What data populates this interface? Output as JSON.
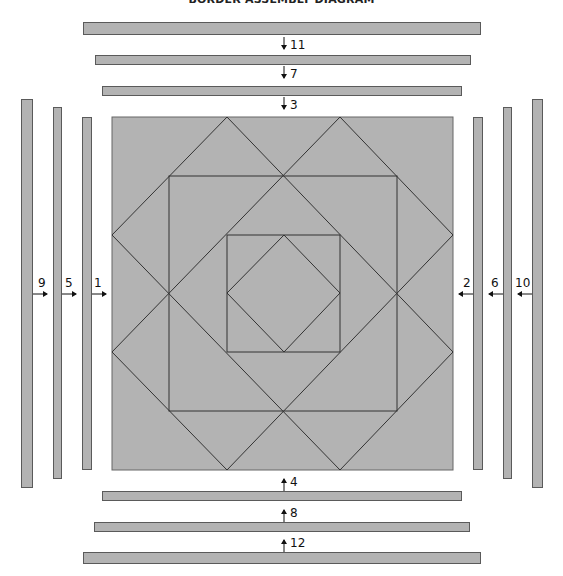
{
  "title": "BORDER ASSEMBLY DIAGRAM",
  "colors": {
    "fabric": "#b3b3b3",
    "outline": "#5a5a5a",
    "seam": "#333333",
    "background": "#ffffff"
  },
  "center_block": {
    "label": "Quilt center",
    "description": "Square-in-a-square block with diamonds",
    "grid_units": 6
  },
  "borders": {
    "top": [
      {
        "number": "11",
        "order": 11,
        "side": "top",
        "arrow": "down"
      },
      {
        "number": "7",
        "order": 7,
        "side": "top",
        "arrow": "down"
      },
      {
        "number": "3",
        "order": 3,
        "side": "top",
        "arrow": "down"
      }
    ],
    "bottom": [
      {
        "number": "4",
        "order": 4,
        "side": "bottom",
        "arrow": "up"
      },
      {
        "number": "8",
        "order": 8,
        "side": "bottom",
        "arrow": "up"
      },
      {
        "number": "12",
        "order": 12,
        "side": "bottom",
        "arrow": "up"
      }
    ],
    "left": [
      {
        "number": "9",
        "order": 9,
        "side": "left",
        "arrow": "right"
      },
      {
        "number": "5",
        "order": 5,
        "side": "left",
        "arrow": "right"
      },
      {
        "number": "1",
        "order": 1,
        "side": "left",
        "arrow": "right"
      }
    ],
    "right": [
      {
        "number": "2",
        "order": 2,
        "side": "right",
        "arrow": "left"
      },
      {
        "number": "6",
        "order": 6,
        "side": "right",
        "arrow": "left"
      },
      {
        "number": "10",
        "order": 10,
        "side": "right",
        "arrow": "left"
      }
    ]
  }
}
